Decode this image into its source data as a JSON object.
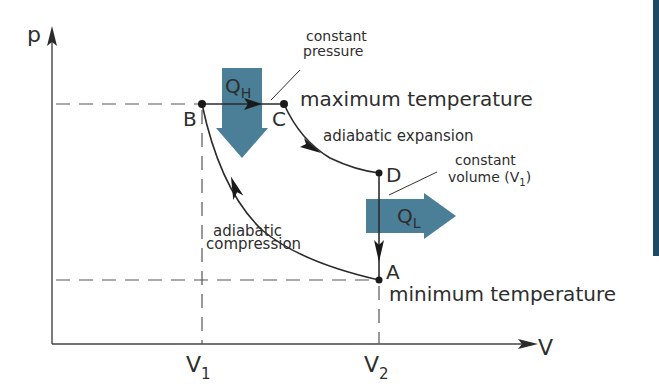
{
  "diagram": {
    "axes": {
      "y_label": "p",
      "x_label": "V",
      "x_ticks": [
        {
          "main": "V",
          "sub": "1"
        },
        {
          "main": "V",
          "sub": "2"
        }
      ]
    },
    "points": {
      "A": "A",
      "B": "B",
      "C": "C",
      "D": "D"
    },
    "labels": {
      "constant_pressure_line1": "constant",
      "constant_pressure_line2": "pressure",
      "max_temp": "maximum temperature",
      "min_temp": "minimum temperature",
      "adiabatic_expansion": "adiabatic expansion",
      "constant_volume_line1": "constant",
      "constant_volume_line2_main": "volume (V",
      "constant_volume_line2_sub": "1",
      "constant_volume_line2_end": ")",
      "adiabatic_compression_line1": "adiabatic",
      "adiabatic_compression_line2": "compression"
    },
    "heat_flows": {
      "hot": {
        "main": "Q",
        "sub": "H"
      },
      "cold": {
        "main": "Q",
        "sub": "L"
      }
    },
    "colors": {
      "heat_arrow": "#4a7f97",
      "line": "#2b2b2b",
      "edge_bar": "#1e4a66"
    }
  }
}
